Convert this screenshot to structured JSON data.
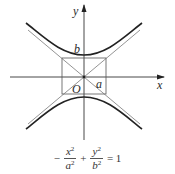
{
  "diagram": {
    "axes": {
      "x_label": "x",
      "y_label": "y",
      "origin_label": "O"
    },
    "labels": {
      "a": "a",
      "b": "b"
    },
    "equation": {
      "sign1": "−",
      "term1_num": "x",
      "term1_den": "a",
      "plus": "+",
      "term2_num": "y",
      "term2_den": "b",
      "exp": "2",
      "rhs": "= 1"
    },
    "colors": {
      "curve": "#222222",
      "axis": "#333333",
      "box": "#555555"
    }
  }
}
